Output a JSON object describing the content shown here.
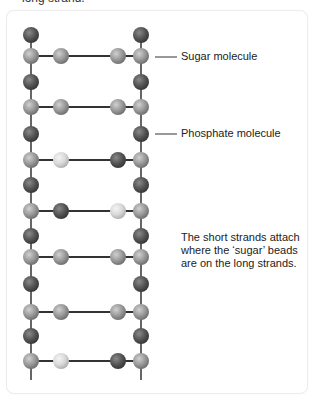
{
  "caption_top": "long strand.",
  "labels": {
    "sugar": "Sugar molecule",
    "phosphate": "Phosphate molecule"
  },
  "note": "The short strands attach where the ‘sugar’ beads are on the long strands.",
  "colors": {
    "sugar_bead": "#9a9a9a",
    "phosphate_bead": "#555555",
    "light_bead": "#d9d9d9",
    "strand": "#666666",
    "rung": "#333333"
  },
  "diagram": {
    "left_strand_x": 31,
    "right_strand_x": 141,
    "inner_left_x": 61,
    "inner_right_x": 118,
    "phosphate_rows": [
      35,
      82,
      134,
      185,
      236,
      284,
      336
    ],
    "rungs": [
      {
        "y": 56,
        "left": "medium",
        "right": "medium"
      },
      {
        "y": 107,
        "left": "medium",
        "right": "medium"
      },
      {
        "y": 160,
        "left": "light",
        "right": "dark"
      },
      {
        "y": 211,
        "left": "dark",
        "right": "light"
      },
      {
        "y": 257,
        "left": "medium",
        "right": "medium"
      },
      {
        "y": 312,
        "left": "medium",
        "right": "medium"
      },
      {
        "y": 361,
        "left": "light",
        "right": "dark"
      }
    ]
  }
}
